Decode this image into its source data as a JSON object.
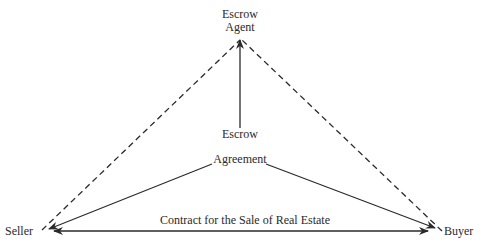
{
  "diagram": {
    "nodes": {
      "escrow_agent": {
        "line1": "Escrow",
        "line2": "Agent"
      },
      "seller": {
        "label": "Seller"
      },
      "buyer": {
        "label": "Buyer"
      }
    },
    "labels": {
      "escrow": "Escrow",
      "agreement": "Agreement",
      "contract": "Contract for the Sale of Real Estate"
    },
    "edges": [
      {
        "from": "Seller",
        "to": "Escrow Agent",
        "style": "dashed"
      },
      {
        "from": "Buyer",
        "to": "Escrow Agent",
        "style": "dashed"
      },
      {
        "from": "Escrow Agreement",
        "to": "Escrow Agent",
        "style": "solid-arrow"
      },
      {
        "from": "Agreement",
        "to": "Seller",
        "style": "solid-arrow"
      },
      {
        "from": "Agreement",
        "to": "Buyer",
        "style": "solid-arrow"
      },
      {
        "from": "Seller",
        "to": "Buyer",
        "style": "double-arrow",
        "label": "Contract for the Sale of Real Estate"
      }
    ],
    "colors": {
      "ink": "#2a2a2a",
      "background": "#ffffff"
    }
  }
}
